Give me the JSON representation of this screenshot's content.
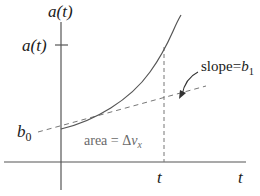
{
  "diagram": {
    "y_axis_label": {
      "base": "a",
      "arg": "(t)"
    },
    "y_tick_label": {
      "base": "a",
      "arg": "(t)"
    },
    "intercept_label": {
      "base": "b",
      "sub": "0"
    },
    "slope_label": {
      "prefix": "slope=",
      "base": "b",
      "sub": "1"
    },
    "area_label": {
      "prefix": "area = Δ",
      "base": "v",
      "sub": "x"
    },
    "x_tick_label": "t",
    "x_axis_label": "t",
    "colors": {
      "axis": "#555555",
      "curve": "#555555",
      "dashed": "#777777",
      "text": "#1a1a1a",
      "area_text": "#6a6a6a"
    }
  }
}
